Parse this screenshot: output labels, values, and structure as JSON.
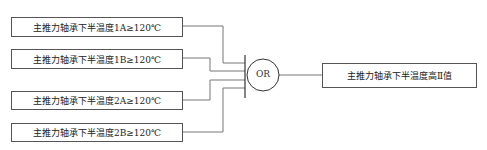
{
  "inputs": [
    {
      "label": "主推力轴承下半温度1A≥120℃"
    },
    {
      "label": "主推力轴承下半温度1B≥120℃"
    },
    {
      "label": "主推力轴承下半温度2A≥120℃"
    },
    {
      "label": "主推力轴承下半温度2B≥120℃"
    }
  ],
  "gate": {
    "label": "OR"
  },
  "output": {
    "label": "主推力轴承下半温度高Ⅱ值"
  }
}
